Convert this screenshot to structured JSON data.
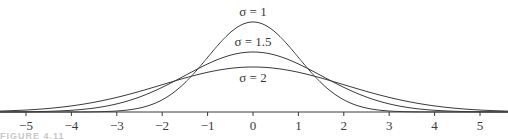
{
  "chart_data": {
    "type": "line",
    "title": "",
    "xlabel": "",
    "ylabel": "",
    "xlim": [
      -5.6,
      5.6
    ],
    "x_ticks": [
      -5,
      -4,
      -3,
      -2,
      -1,
      0,
      1,
      2,
      3,
      4,
      5
    ],
    "x_tick_labels": [
      "−5",
      "−4",
      "−3",
      "−2",
      "−1",
      "0",
      "1",
      "2",
      "3",
      "4",
      "5"
    ],
    "grid": false,
    "legend": "inline labels above each curve peak",
    "function": "normal density N(0, σ²)",
    "series": [
      {
        "name": "σ = 1",
        "sigma": 1,
        "peak": 0.399
      },
      {
        "name": "σ = 1.5",
        "sigma": 1.5,
        "peak": 0.266
      },
      {
        "name": "σ = 2",
        "sigma": 2,
        "peak": 0.199
      }
    ],
    "annotations": [
      "σ = 1",
      "σ = 1.5",
      "σ = 2"
    ]
  },
  "caption": {
    "text": "FIGURE 4.11"
  }
}
